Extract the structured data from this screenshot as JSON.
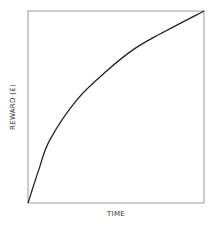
{
  "chart_data": {
    "type": "line",
    "title": "",
    "xlabel": "TIME",
    "ylabel": "REWARD (£)",
    "grid": false,
    "legend": null,
    "xlim": [
      0,
      1
    ],
    "ylim": [
      0,
      1
    ],
    "x_ticks": [],
    "y_ticks": [],
    "series": [
      {
        "name": "reward",
        "x": [
          0,
          0.06,
          0.125,
          0.28,
          0.45,
          0.6,
          0.75,
          1.0
        ],
        "values": [
          0,
          0.17,
          0.33,
          0.54,
          0.69,
          0.8,
          0.88,
          1.0
        ]
      }
    ]
  },
  "style": {
    "line_color": "#222222",
    "frame_color": "#999999",
    "text_color": "#333333"
  }
}
